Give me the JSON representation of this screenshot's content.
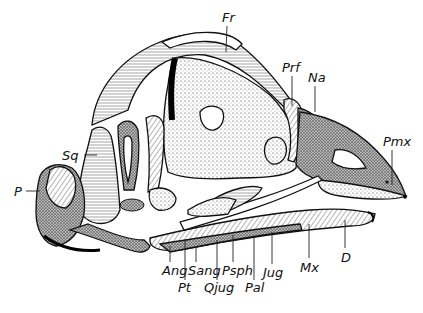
{
  "figure": {
    "labels": [
      {
        "id": "fr",
        "text": "Fr",
        "x": 222,
        "y": 22,
        "lx1": 227,
        "ly1": 26,
        "lx2": 226,
        "ly2": 52
      },
      {
        "id": "prf",
        "text": "Prf",
        "x": 282,
        "y": 72,
        "lx1": 292,
        "ly1": 76,
        "lx2": 292,
        "ly2": 106
      },
      {
        "id": "na",
        "text": "Na",
        "x": 308,
        "y": 82,
        "lx1": 315,
        "ly1": 86,
        "lx2": 315,
        "ly2": 112
      },
      {
        "id": "pmx",
        "text": "Pmx",
        "x": 383,
        "y": 146,
        "lx1": 392,
        "ly1": 150,
        "lx2": 392,
        "ly2": 185
      },
      {
        "id": "sq",
        "text": "Sq",
        "x": 62,
        "y": 160,
        "lx1": 84,
        "ly1": 155,
        "lx2": 97,
        "ly2": 155
      },
      {
        "id": "p",
        "text": "P",
        "x": 14,
        "y": 196,
        "lx1": 26,
        "ly1": 191,
        "lx2": 40,
        "ly2": 191
      },
      {
        "id": "d",
        "text": "D",
        "x": 341,
        "y": 262,
        "lx1": 345,
        "ly1": 220,
        "lx2": 345,
        "ly2": 248
      },
      {
        "id": "ang",
        "text": "Ang",
        "x": 162,
        "y": 275,
        "lx1": 170,
        "ly1": 246,
        "lx2": 170,
        "ly2": 262
      },
      {
        "id": "pt",
        "text": "Pt",
        "x": 178,
        "y": 292,
        "lx1": 185,
        "ly1": 240,
        "lx2": 185,
        "ly2": 280
      },
      {
        "id": "sang",
        "text": "Sang",
        "x": 188,
        "y": 275,
        "lx1": 196,
        "ly1": 246,
        "lx2": 196,
        "ly2": 262
      },
      {
        "id": "qjug",
        "text": "Qjug",
        "x": 204,
        "y": 292,
        "lx1": 217,
        "ly1": 240,
        "lx2": 217,
        "ly2": 280
      },
      {
        "id": "psph",
        "text": "Psph",
        "x": 222,
        "y": 275,
        "lx1": 233,
        "ly1": 235,
        "lx2": 233,
        "ly2": 262
      },
      {
        "id": "pal",
        "text": "Pal",
        "x": 245,
        "y": 292,
        "lx1": 254,
        "ly1": 236,
        "lx2": 254,
        "ly2": 280
      },
      {
        "id": "jug",
        "text": "Jug",
        "x": 263,
        "y": 277,
        "lx1": 272,
        "ly1": 232,
        "lx2": 272,
        "ly2": 264
      },
      {
        "id": "mx",
        "text": "Mx",
        "x": 300,
        "y": 272,
        "lx1": 309,
        "ly1": 224,
        "lx2": 309,
        "ly2": 258
      }
    ]
  }
}
